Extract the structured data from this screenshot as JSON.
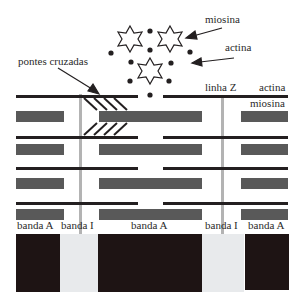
{
  "labels": {
    "myosin_cross_section": "miosina",
    "actin_cross_section": "actina",
    "cross_bridges": "pontes cruzadas",
    "z_line": "linha Z",
    "actin": "actina",
    "myosin": "miosina"
  },
  "bands": [
    {
      "label": "banda A",
      "type": "A"
    },
    {
      "label": "banda I",
      "type": "I"
    },
    {
      "label": "banda A",
      "type": "A"
    },
    {
      "label": "banda I",
      "type": "I"
    },
    {
      "label": "banda A",
      "type": "A"
    }
  ],
  "colors": {
    "actin": "#231f20",
    "myosin": "#595959",
    "z_line": "#b3b3b3",
    "band_A": "#1e1414",
    "band_I": "#e8eaec"
  }
}
